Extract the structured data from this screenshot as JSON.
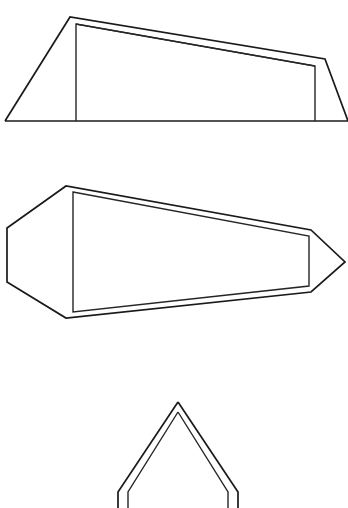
{
  "document": {
    "title": "Tent orthographic views",
    "background_color": "#ffffff",
    "line_color": "#1a1a1a",
    "width": 348,
    "height": 508
  },
  "figures": [
    {
      "id": "figure-1",
      "name": "tent-side-elevation",
      "caption": "Side elevation of a ridge tent",
      "paths": {
        "ground_line": "M 5 121 L 348 121",
        "outer_shell": "M 5 121 L 70 17 L 325 59 L 348 121",
        "inner_panel": "M 76 121 L 76 24 L 315 66 L 315 121",
        "ridge_inner": "M 76 24 L 315 66"
      }
    },
    {
      "id": "figure-2",
      "name": "tent-plan-view",
      "caption": "Plan (top) view of the tent showing the tapered body and guy point",
      "paths": {
        "outer_shell": "M 7 228 L 66 186 L 311 230 L 345 262 L 311 292 L 66 318 L 7 282 Z",
        "inner_panel": "M 73 192 L 309 236 L 309 286 L 73 312 Z"
      }
    },
    {
      "id": "figure-3",
      "name": "tent-front-elevation",
      "caption": "Front elevation (cross section) of the tent, cropped at the page edge",
      "paths": {
        "outer_shell": "M 178 402 L 118 492 L 118 508",
        "outer_shell_right": "M 178 402 L 238 492 L 238 508",
        "inner_panel_left": "M 178 412 L 128 492 L 128 508",
        "inner_panel_right": "M 178 412 L 228 492 L 228 508"
      }
    }
  ]
}
